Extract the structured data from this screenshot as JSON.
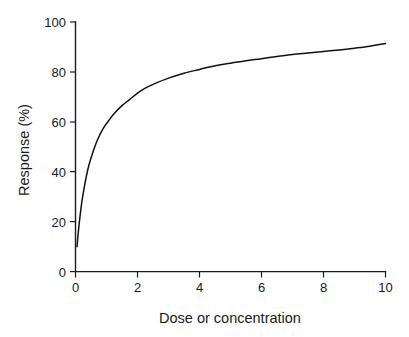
{
  "chart_data": {
    "type": "line",
    "title": "",
    "subtitle": "",
    "xlabel": "Dose or concentration",
    "ylabel": "Response (%)",
    "xlim": [
      0,
      10
    ],
    "ylim": [
      0,
      100
    ],
    "xticks": [
      0,
      2,
      4,
      6,
      8,
      10
    ],
    "xtick_labels": [
      "0",
      "2",
      "4",
      "6",
      "8",
      "10"
    ],
    "yticks": [
      0,
      20,
      40,
      60,
      80,
      100
    ],
    "ytick_labels": [
      "0",
      "20",
      "40",
      "60",
      "80",
      "100"
    ],
    "grid": false,
    "legend": null,
    "legend_position": "none",
    "annotations": [],
    "line_color": "#111111",
    "series": [
      {
        "name": "Dose-response",
        "x": [
          0.05,
          0.1,
          0.2,
          0.3,
          0.4,
          0.5,
          0.7,
          0.9,
          1.1,
          1.3,
          1.5,
          1.75,
          2.0,
          2.25,
          2.5,
          3.0,
          3.5,
          4.0,
          4.5,
          5.0,
          5.5,
          6.0,
          6.5,
          7.0,
          7.5,
          8.0,
          8.5,
          9.0,
          9.5,
          10.0
        ],
        "y": [
          10.0,
          17.0,
          27.5,
          35.0,
          41.0,
          45.5,
          52.5,
          57.5,
          61.0,
          64.0,
          66.5,
          69.0,
          71.5,
          73.5,
          75.0,
          77.5,
          79.5,
          81.0,
          82.5,
          83.5,
          84.5,
          85.3,
          86.2,
          87.0,
          87.6,
          88.2,
          88.8,
          89.5,
          90.3,
          91.4
        ]
      }
    ]
  },
  "axes": {
    "x_axis_name": "Dose or concentration",
    "y_axis_name": "Response (%)"
  }
}
